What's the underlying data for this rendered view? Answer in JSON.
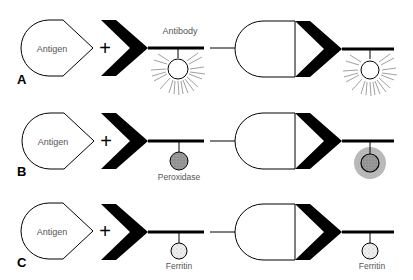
{
  "figure": {
    "rows": [
      {
        "id": "A",
        "row_label": "A",
        "y": 48,
        "antigen_label": "Antigen",
        "operator": "+",
        "antibody_label": "Antibody",
        "marker": "fluorescent",
        "marker_label": "",
        "result_marker": "fluorescent",
        "result_marker_label": ""
      },
      {
        "id": "B",
        "row_label": "B",
        "y": 141,
        "antigen_label": "Antigen",
        "operator": "+",
        "antibody_label": "",
        "marker": "peroxidase",
        "marker_label": "Peroxidase",
        "result_marker": "peroxidase-stain",
        "result_marker_label": ""
      },
      {
        "id": "C",
        "row_label": "C",
        "y": 232,
        "antigen_label": "Antigen",
        "operator": "+",
        "antibody_label": "",
        "marker": "ferritin",
        "marker_label": "Ferritin",
        "result_marker": "ferritin",
        "result_marker_label": "Ferritin"
      }
    ],
    "colors": {
      "ink": "#000000",
      "text": "#555555",
      "peroxidase_fill": "#9a9a9a",
      "stain_halo": "#b5b5b5",
      "ferritin_fill": "#e6e6e6"
    }
  }
}
